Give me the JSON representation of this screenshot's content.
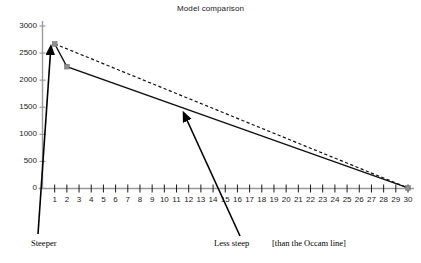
{
  "chart_data": {
    "type": "line",
    "title": "Model comparison",
    "xlabel": "",
    "ylabel": "",
    "grid": false,
    "legend_position": "none",
    "xlim": [
      0,
      30
    ],
    "ylim": [
      0,
      3000
    ],
    "x_ticks": [
      "1",
      "2",
      "3",
      "4",
      "5",
      "6",
      "7",
      "8",
      "9",
      "10",
      "11",
      "12",
      "13",
      "14",
      "15",
      "16",
      "17",
      "18",
      "19",
      "20",
      "21",
      "22",
      "23",
      "24",
      "25",
      "26",
      "27",
      "28",
      "29",
      "30"
    ],
    "y_ticks": [
      "0",
      "500",
      "1000",
      "1500",
      "2000",
      "2500",
      "3000"
    ],
    "series": [
      {
        "name": "Occam line",
        "style": "dashed",
        "color": "#111111",
        "x": [
          1,
          30
        ],
        "values": [
          2670,
          10
        ]
      },
      {
        "name": "Model line",
        "style": "solid",
        "color": "#111111",
        "x": [
          1,
          2,
          30
        ],
        "values": [
          2670,
          2250,
          10
        ]
      }
    ],
    "markers": [
      {
        "x": 1,
        "value": 2670,
        "color": "#8c8c8c"
      },
      {
        "x": 2,
        "value": 2250,
        "color": "#8c8c8c"
      },
      {
        "x": 30,
        "value": 10,
        "color": "#8c8c8c"
      }
    ],
    "annotations": [
      {
        "text": "Steeper",
        "target_x": 1.35,
        "target_value": 2520
      },
      {
        "text": "Less steep",
        "target_x": 12.1,
        "target_value": 1400
      },
      {
        "text": "[than the Occam line]",
        "target_x": null,
        "target_value": null
      }
    ]
  },
  "axis_color": "#9a9a9a",
  "tick_color": "#1a1a1a",
  "labels": {
    "steeper": "Steeper",
    "less_steep": "Less steep",
    "occam_note": "[than the Occam line]"
  }
}
